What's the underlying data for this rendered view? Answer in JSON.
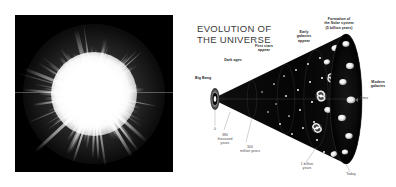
{
  "figure": {
    "name": "evolution-of-the-universe-figure",
    "panels": [
      "cosmic-burst-photo",
      "evolution-of-the-universe-diagram"
    ]
  },
  "burst_panel": {
    "name": "cosmic-burst-image",
    "description": "white radial starburst on black background",
    "background_color": "#000000",
    "burst_color": "#ffffff",
    "ray_count": 190
  },
  "cone_panel": {
    "title": "EVOLUTION OF\nTHE UNIVERSE",
    "title_color": "#3a3a3a",
    "background_color": "#ffffff",
    "cone_color": "#080808",
    "time_axis": {
      "label": "Time",
      "direction": "left-to-right",
      "arrow_icon": "arrow-right-icon"
    },
    "event_labels": [
      {
        "id": "big-bang",
        "text": "Big Bang"
      },
      {
        "id": "dark-ages",
        "text": "Dark ages"
      },
      {
        "id": "first-stars",
        "text": "First stars\nappear"
      },
      {
        "id": "early-galaxies",
        "text": "Early\ngalaxies\nappear"
      },
      {
        "id": "solar-system",
        "text": "Formation of\nthe Solar system\n(5 billion years)"
      },
      {
        "id": "modern-galaxies",
        "text": "Modern\ngalaxies"
      }
    ],
    "time_markers": [
      {
        "id": "origin",
        "text": "0"
      },
      {
        "id": "recombination",
        "text": "380\nthousand\nyears"
      },
      {
        "id": "first-light",
        "text": "300\nmillion years"
      },
      {
        "id": "one-billion-years",
        "text": "1 billion\nyears"
      },
      {
        "id": "today",
        "text": "Today"
      }
    ]
  }
}
